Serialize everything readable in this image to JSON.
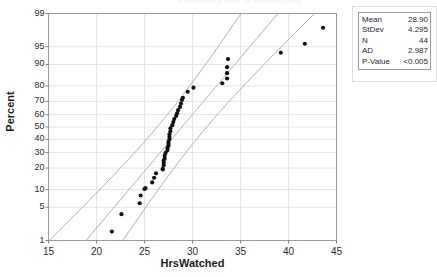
{
  "title": "Probability Plot of HrsWatched",
  "chart_data": {
    "type": "scatter",
    "plot_kind": "normal-probability-plot",
    "title": "Probability Plot of HrsWatched",
    "xlabel": "HrsWatched",
    "ylabel": "Percent",
    "xlim": [
      15,
      45
    ],
    "ylim": [
      1,
      99
    ],
    "grid": true,
    "yscale": "normal-probability",
    "xticks": [
      15,
      20,
      25,
      30,
      35,
      40,
      45
    ],
    "xtick_labels": [
      "15",
      "20",
      "25",
      "30",
      "35",
      "40",
      "45"
    ],
    "yticks": [
      1,
      5,
      10,
      20,
      30,
      40,
      50,
      60,
      70,
      80,
      90,
      95,
      99
    ],
    "ytick_labels": [
      "1",
      "5",
      "10",
      "20",
      "30",
      "40",
      "50",
      "60",
      "70",
      "80",
      "90",
      "95",
      "99"
    ],
    "points": [
      {
        "x": 21.6,
        "y": 1.6
      },
      {
        "x": 22.6,
        "y": 3.7
      },
      {
        "x": 24.5,
        "y": 5.9
      },
      {
        "x": 24.6,
        "y": 8.0
      },
      {
        "x": 25.0,
        "y": 10.2
      },
      {
        "x": 25.1,
        "y": 10.5
      },
      {
        "x": 25.8,
        "y": 12.8
      },
      {
        "x": 26.0,
        "y": 14.9
      },
      {
        "x": 26.2,
        "y": 17.1
      },
      {
        "x": 26.9,
        "y": 19.2
      },
      {
        "x": 26.9,
        "y": 19.5
      },
      {
        "x": 27.0,
        "y": 21.5
      },
      {
        "x": 27.0,
        "y": 23.0
      },
      {
        "x": 27.0,
        "y": 24.5
      },
      {
        "x": 27.1,
        "y": 26.0
      },
      {
        "x": 27.1,
        "y": 28.0
      },
      {
        "x": 27.2,
        "y": 29.8
      },
      {
        "x": 27.4,
        "y": 31.8
      },
      {
        "x": 27.4,
        "y": 33.5
      },
      {
        "x": 27.5,
        "y": 35.0
      },
      {
        "x": 27.5,
        "y": 36.5
      },
      {
        "x": 27.5,
        "y": 38.0
      },
      {
        "x": 27.6,
        "y": 40.0
      },
      {
        "x": 27.6,
        "y": 42.0
      },
      {
        "x": 27.6,
        "y": 44.0
      },
      {
        "x": 27.7,
        "y": 46.5
      },
      {
        "x": 27.7,
        "y": 49.0
      },
      {
        "x": 27.9,
        "y": 51.5
      },
      {
        "x": 28.0,
        "y": 54.0
      },
      {
        "x": 28.1,
        "y": 56.5
      },
      {
        "x": 28.3,
        "y": 59.0
      },
      {
        "x": 28.4,
        "y": 61.0
      },
      {
        "x": 28.5,
        "y": 63.5
      },
      {
        "x": 28.7,
        "y": 66.0
      },
      {
        "x": 28.8,
        "y": 68.5
      },
      {
        "x": 28.9,
        "y": 71.0
      },
      {
        "x": 29.0,
        "y": 72.5
      },
      {
        "x": 29.5,
        "y": 76.5
      },
      {
        "x": 30.1,
        "y": 79.0
      },
      {
        "x": 33.1,
        "y": 81.5
      },
      {
        "x": 33.6,
        "y": 84.0
      },
      {
        "x": 33.6,
        "y": 86.5
      },
      {
        "x": 33.6,
        "y": 89.0
      },
      {
        "x": 33.7,
        "y": 91.8
      },
      {
        "x": 39.2,
        "y": 93.6
      },
      {
        "x": 41.7,
        "y": 95.6
      },
      {
        "x": 43.6,
        "y": 97.9
      }
    ],
    "fit_line": {
      "label": "normal fit line",
      "mean": 28.9,
      "stdev": 4.295,
      "color": "#a6a6a6"
    },
    "confidence_bands": {
      "label": "95% confidence interval bands",
      "color": "#a6a6a6"
    },
    "marker": {
      "shape": "filled-circle",
      "color": "#111111",
      "size": 3
    }
  },
  "stats": {
    "rows": [
      {
        "key": "Mean",
        "value": "28.90"
      },
      {
        "key": "StDev",
        "value": "4.295"
      },
      {
        "key": "N",
        "value": "44"
      },
      {
        "key": "AD",
        "value": "2.987"
      },
      {
        "key": "P-Value",
        "value": "<0.005"
      }
    ]
  },
  "colors": {
    "marker": "#111111",
    "line": "#a6a6a6",
    "axis": "#808080",
    "grid": "#e4e4e6",
    "text": "#1f1f1f"
  }
}
